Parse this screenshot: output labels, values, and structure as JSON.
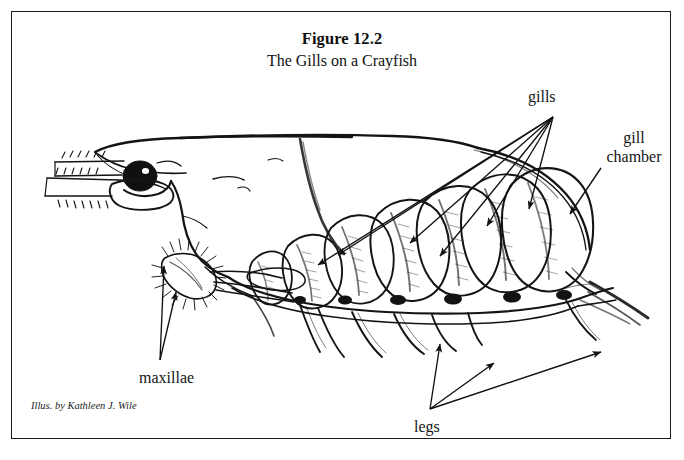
{
  "figure": {
    "title": "Figure 12.2",
    "subtitle": "The Gills on a Crayfish",
    "credit": "Illus. by Kathleen J. Wile",
    "border_color": "#1a1a1a",
    "ink_color": "#111111",
    "background_color": "#ffffff"
  },
  "labels": {
    "gills": "gills",
    "gill_chamber": "gill\nchamber",
    "gill_chamber_line1": "gill",
    "gill_chamber_line2": "chamber",
    "maxillae": "maxillae",
    "legs": "legs"
  },
  "annotations": [
    {
      "name": "gills",
      "text": "gills",
      "anchor_x": 553,
      "anchor_y": 117,
      "arrow_count": 6,
      "targets": [
        {
          "x": 314,
          "y": 268
        },
        {
          "x": 334,
          "y": 258
        },
        {
          "x": 407,
          "y": 245
        },
        {
          "x": 437,
          "y": 258
        },
        {
          "x": 485,
          "y": 227
        },
        {
          "x": 527,
          "y": 210
        }
      ]
    },
    {
      "name": "gill-chamber",
      "text": "gill chamber",
      "anchor_x": 599,
      "anchor_y": 170,
      "arrow_count": 1,
      "targets": [
        {
          "x": 568,
          "y": 216
        }
      ]
    },
    {
      "name": "maxillae",
      "text": "maxillae",
      "anchor_x": 160,
      "anchor_y": 362,
      "arrow_count": 2,
      "targets": [
        {
          "x": 163,
          "y": 266
        },
        {
          "x": 174,
          "y": 292
        }
      ]
    },
    {
      "name": "legs",
      "text": "legs",
      "anchor_x": 430,
      "anchor_y": 411,
      "arrow_count": 3,
      "targets": [
        {
          "x": 439,
          "y": 343
        },
        {
          "x": 492,
          "y": 362
        },
        {
          "x": 599,
          "y": 351
        }
      ]
    }
  ],
  "subject": {
    "name": "crayfish",
    "view": "lateral",
    "parts": [
      "rostrum",
      "eye",
      "antennule",
      "antennal scale",
      "carapace",
      "cervical groove",
      "maxillae",
      "gills",
      "gill chamber",
      "walking legs",
      "abdomen",
      "uropod"
    ],
    "gill_count": 7
  }
}
